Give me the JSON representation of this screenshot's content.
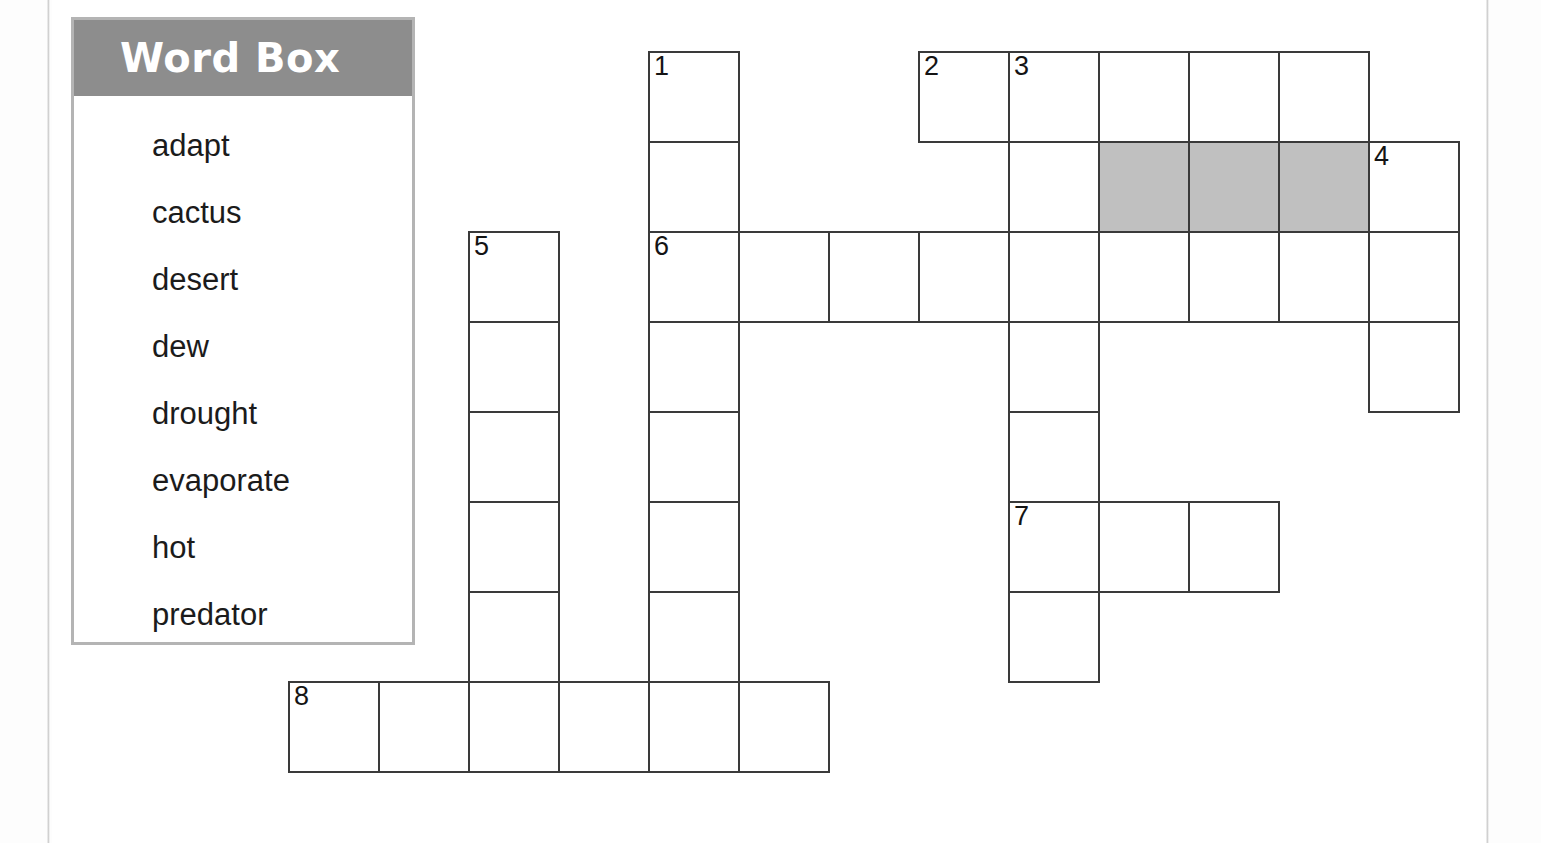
{
  "worksheet": {
    "type": "crossword-puzzle",
    "word_box": {
      "title": "Word Box",
      "words": [
        "adapt",
        "cactus",
        "desert",
        "dew",
        "drought",
        "evaporate",
        "hot",
        "predator"
      ]
    },
    "colors": {
      "header_background": "#8d8d8d",
      "header_text": "#ffffff",
      "box_border": "#b4b4b4",
      "grid_line": "#3a3a3a",
      "shaded_cell": "#c0c0c0",
      "page_background": "#ffffff"
    }
  },
  "grid": {
    "cell_size": 90,
    "origin_x": 288,
    "origin_y": 51,
    "columns": 13,
    "rows": 8,
    "clue_numbers": [
      "1",
      "2",
      "3",
      "4",
      "5",
      "6",
      "7",
      "8"
    ],
    "cells": [
      {
        "col": 4,
        "row": 0,
        "num": "1",
        "shaded": false
      },
      {
        "col": 7,
        "row": 0,
        "num": "2",
        "shaded": false
      },
      {
        "col": 8,
        "row": 0,
        "num": "3",
        "shaded": false
      },
      {
        "col": 9,
        "row": 0,
        "num": "",
        "shaded": false
      },
      {
        "col": 10,
        "row": 0,
        "num": "",
        "shaded": false
      },
      {
        "col": 11,
        "row": 0,
        "num": "",
        "shaded": false
      },
      {
        "col": 4,
        "row": 1,
        "num": "",
        "shaded": false
      },
      {
        "col": 8,
        "row": 1,
        "num": "",
        "shaded": false
      },
      {
        "col": 9,
        "row": 1,
        "num": "",
        "shaded": true
      },
      {
        "col": 10,
        "row": 1,
        "num": "",
        "shaded": true
      },
      {
        "col": 11,
        "row": 1,
        "num": "",
        "shaded": true
      },
      {
        "col": 12,
        "row": 1,
        "num": "4",
        "shaded": false
      },
      {
        "col": 2,
        "row": 2,
        "num": "5",
        "shaded": false
      },
      {
        "col": 4,
        "row": 2,
        "num": "6",
        "shaded": false
      },
      {
        "col": 5,
        "row": 2,
        "num": "",
        "shaded": false
      },
      {
        "col": 6,
        "row": 2,
        "num": "",
        "shaded": false
      },
      {
        "col": 7,
        "row": 2,
        "num": "",
        "shaded": false
      },
      {
        "col": 8,
        "row": 2,
        "num": "",
        "shaded": false
      },
      {
        "col": 9,
        "row": 2,
        "num": "",
        "shaded": false
      },
      {
        "col": 10,
        "row": 2,
        "num": "",
        "shaded": false
      },
      {
        "col": 11,
        "row": 2,
        "num": "",
        "shaded": false
      },
      {
        "col": 12,
        "row": 2,
        "num": "",
        "shaded": false
      },
      {
        "col": 2,
        "row": 3,
        "num": "",
        "shaded": false
      },
      {
        "col": 4,
        "row": 3,
        "num": "",
        "shaded": false
      },
      {
        "col": 8,
        "row": 3,
        "num": "",
        "shaded": false
      },
      {
        "col": 12,
        "row": 3,
        "num": "",
        "shaded": false
      },
      {
        "col": 2,
        "row": 4,
        "num": "",
        "shaded": false
      },
      {
        "col": 4,
        "row": 4,
        "num": "",
        "shaded": false
      },
      {
        "col": 8,
        "row": 4,
        "num": "",
        "shaded": false
      },
      {
        "col": 2,
        "row": 5,
        "num": "",
        "shaded": false
      },
      {
        "col": 4,
        "row": 5,
        "num": "",
        "shaded": false
      },
      {
        "col": 8,
        "row": 5,
        "num": "7",
        "shaded": false
      },
      {
        "col": 9,
        "row": 5,
        "num": "",
        "shaded": false
      },
      {
        "col": 10,
        "row": 5,
        "num": "",
        "shaded": false
      },
      {
        "col": 2,
        "row": 6,
        "num": "",
        "shaded": false
      },
      {
        "col": 4,
        "row": 6,
        "num": "",
        "shaded": false
      },
      {
        "col": 8,
        "row": 6,
        "num": "",
        "shaded": false
      },
      {
        "col": 0,
        "row": 7,
        "num": "8",
        "shaded": false
      },
      {
        "col": 1,
        "row": 7,
        "num": "",
        "shaded": false
      },
      {
        "col": 2,
        "row": 7,
        "num": "",
        "shaded": false
      },
      {
        "col": 3,
        "row": 7,
        "num": "",
        "shaded": false
      },
      {
        "col": 4,
        "row": 7,
        "num": "",
        "shaded": false
      },
      {
        "col": 5,
        "row": 7,
        "num": "",
        "shaded": false
      }
    ]
  }
}
